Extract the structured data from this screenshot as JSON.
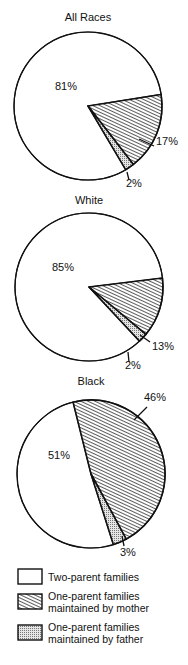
{
  "chart_data": [
    {
      "type": "pie",
      "title": "All Races",
      "slices": [
        {
          "label": "Two-parent families",
          "value": 81,
          "text": "81%"
        },
        {
          "label": "One-parent families maintained by mother",
          "value": 17,
          "text": "17%"
        },
        {
          "label": "One-parent families maintained by father",
          "value": 2,
          "text": "2%"
        }
      ]
    },
    {
      "type": "pie",
      "title": "White",
      "slices": [
        {
          "label": "Two-parent families",
          "value": 85,
          "text": "85%"
        },
        {
          "label": "One-parent families maintained by mother",
          "value": 13,
          "text": "13%"
        },
        {
          "label": "One-parent families maintained by father",
          "value": 2,
          "text": "2%"
        }
      ]
    },
    {
      "type": "pie",
      "title": "Black",
      "slices": [
        {
          "label": "Two-parent families",
          "value": 51,
          "text": "51%"
        },
        {
          "label": "One-parent families maintained by mother",
          "value": 46,
          "text": "46%"
        },
        {
          "label": "One-parent families maintained by father",
          "value": 3,
          "text": "3%"
        }
      ]
    }
  ],
  "legend": {
    "position": "bottom",
    "items": [
      {
        "lines": [
          "Two-parent families"
        ],
        "fill": "blank"
      },
      {
        "lines": [
          "One-parent families",
          "maintained by mother"
        ],
        "fill": "diagonal-hatch"
      },
      {
        "lines": [
          "One-parent families",
          "maintained by father"
        ],
        "fill": "stipple"
      }
    ]
  },
  "colors": {
    "ink": "#111111",
    "paper": "#ffffff",
    "stipple": "#cfcfcf"
  }
}
